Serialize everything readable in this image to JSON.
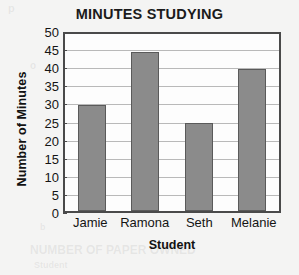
{
  "chart_data": {
    "type": "bar",
    "title": "MINUTES STUDYING",
    "xlabel": "Student",
    "ylabel": "Number of Minutes",
    "categories": [
      "Jamie",
      "Ramona",
      "Seth",
      "Melanie"
    ],
    "values": [
      30,
      45,
      25,
      40
    ],
    "ylim": [
      0,
      50
    ],
    "ytick_step": 5,
    "yticks": [
      50,
      45,
      40,
      35,
      30,
      25,
      20,
      15,
      10,
      5,
      0
    ],
    "grid": true,
    "legend": false,
    "series": [
      {
        "name": "Minutes Studying",
        "values": [
          30,
          45,
          25,
          40
        ]
      }
    ],
    "colors": {
      "bar_fill": "#8b8b8b",
      "bar_border": "#5a5a5a",
      "frame": "#4a4a4a",
      "gridline": "#b9b9b9",
      "plot_background": "#fdfdfd",
      "page_background": "#f4f4f3",
      "text": "#141414"
    }
  },
  "background_bleed": {
    "line1": "p",
    "line2": "o",
    "line3": "r",
    "line4": "b",
    "line5": "NUMBER OF PAPER OWNED",
    "line6": "Student"
  }
}
